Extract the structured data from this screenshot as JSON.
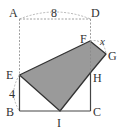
{
  "figure": {
    "type": "geometry-folding-diagram",
    "colors": {
      "shade": "#9a9a9a",
      "line": "#444444",
      "dashed": "#888888",
      "text": "#333333"
    },
    "points": {
      "A": {
        "label": "A",
        "x": 19.5,
        "y": 19
      },
      "D": {
        "label": "D",
        "x": 90.5,
        "y": 19
      },
      "F": {
        "label": "F",
        "x": 90,
        "y": 41
      },
      "G": {
        "label": "G",
        "x": 106,
        "y": 54
      },
      "E": {
        "label": "E",
        "x": 19.5,
        "y": 75
      },
      "H": {
        "label": "H",
        "x": 91,
        "y": 72
      },
      "B": {
        "label": "B",
        "x": 19.5,
        "y": 111
      },
      "I": {
        "label": "I",
        "x": 60,
        "y": 111
      },
      "C": {
        "label": "C",
        "x": 90.5,
        "y": 111
      }
    },
    "measures": {
      "AD": "8",
      "EB": "4",
      "FG": "x"
    },
    "shaded_polygon": [
      "E",
      "F",
      "G",
      "H",
      "I"
    ]
  }
}
